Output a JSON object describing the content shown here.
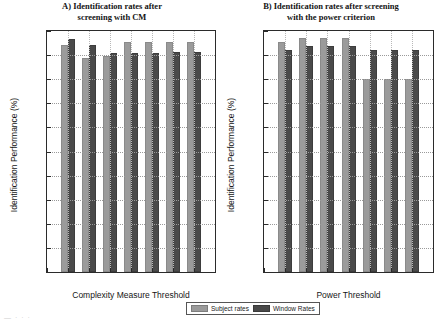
{
  "figure": {
    "legend": {
      "subject_label": "Subject rates",
      "window_label": "Window Rates",
      "subject_color": "#9b9b9b",
      "window_color": "#4a4a4a"
    },
    "caption_fragment": "—  · · ·"
  },
  "chart_data": [
    {
      "type": "bar",
      "panel": "A",
      "title": "A) Identification rates after screening with CM",
      "title_line1": "A) Identification rates after",
      "title_line2": "screening with CM",
      "xlabel": "Complexity Measure Threshold",
      "ylabel": "Identification Performance (%)",
      "xlim": [
        0.025,
        0.065
      ],
      "ylim": [
        0,
        100
      ],
      "xticks": [
        0.025,
        0.03,
        0.035,
        0.04,
        0.045,
        0.05,
        0.055,
        0.06,
        0.065
      ],
      "xticklabels": [
        "0.025",
        "0.03",
        "0.035",
        "0.04",
        "0.045",
        "0.05",
        "0.055",
        "0.06",
        "0.065"
      ],
      "yticks": [
        0,
        10,
        20,
        30,
        40,
        50,
        60,
        70,
        80,
        90,
        100
      ],
      "yticklabels": [
        "0",
        "10",
        "20",
        "30",
        "40",
        "50",
        "60",
        "70",
        "80",
        "90",
        "100"
      ],
      "grid": true,
      "legend_position": "below-figure-center",
      "categories": [
        0.03,
        0.035,
        0.04,
        0.045,
        0.05,
        0.055,
        0.06
      ],
      "series": [
        {
          "name": "Subject rates",
          "color": "#9b9b9b",
          "values": [
            94.0,
            89.0,
            89.5,
            95.3,
            95.3,
            95.3,
            95.3
          ]
        },
        {
          "name": "Window Rates",
          "color": "#4a4a4a",
          "values": [
            96.8,
            94.0,
            91.0,
            91.0,
            90.8,
            91.3,
            91.3
          ]
        }
      ]
    },
    {
      "type": "bar",
      "panel": "B",
      "title": "B) Identification rates after screening with the power criterion",
      "title_line1": "B) Identification rates after screening",
      "title_line2": "with the power criterion",
      "xlabel": "Power Threshold",
      "ylabel": "Identification Performance (%)",
      "xlim": [
        3,
        7
      ],
      "ylim": [
        0,
        100
      ],
      "xticks": [
        3,
        3.5,
        4,
        4.5,
        5,
        5.5,
        6,
        6.5,
        7
      ],
      "xticklabels": [
        "3",
        "3.5",
        "4",
        "4.5",
        "5",
        "5.5",
        "6",
        "6.5",
        "7"
      ],
      "yticks": [
        0,
        10,
        20,
        30,
        40,
        50,
        60,
        70,
        80,
        90,
        100
      ],
      "yticklabels": [
        "0",
        "10",
        "20",
        "30",
        "40",
        "50",
        "60",
        "70",
        "80",
        "90",
        "100"
      ],
      "grid": true,
      "legend_position": "below-figure-center",
      "categories": [
        3.5,
        4,
        4.5,
        5,
        5.5,
        6,
        6.5
      ],
      "series": [
        {
          "name": "Subject rates",
          "color": "#9b9b9b",
          "values": [
            95.4,
            96.9,
            96.9,
            96.9,
            80.0,
            80.0,
            80.0
          ]
        },
        {
          "name": "Window Rates",
          "color": "#4a4a4a",
          "values": [
            92.3,
            93.8,
            93.8,
            93.8,
            92.3,
            92.3,
            92.3
          ]
        }
      ]
    }
  ]
}
